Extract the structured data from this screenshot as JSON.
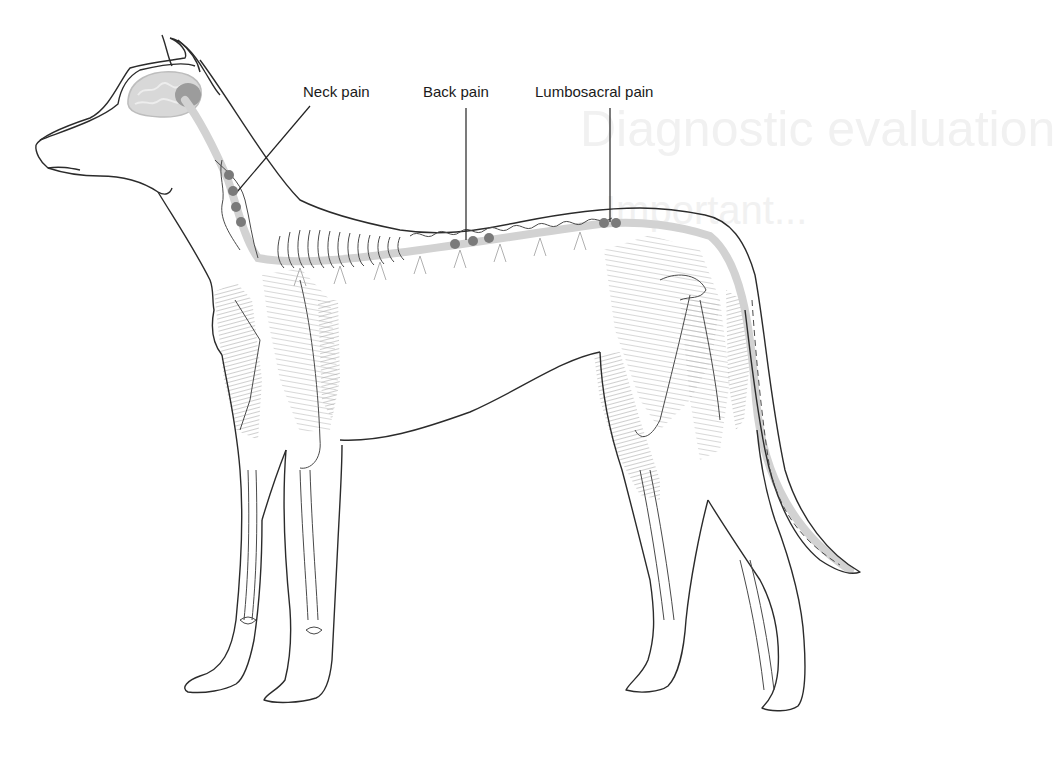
{
  "figure": {
    "labels": [
      {
        "id": "neck",
        "text": "Neck pain"
      },
      {
        "id": "back",
        "text": "Back pain"
      },
      {
        "id": "lumbosacral",
        "text": "Lumbosacral pain"
      }
    ],
    "pain_markers": {
      "neck": {
        "count": 4
      },
      "back": {
        "count": 3
      },
      "lumbosacral": {
        "count": 2
      }
    },
    "background_bleed_text": [
      "Diagnostic evaluation",
      "Important..."
    ],
    "colors": {
      "outline": "#2b2b2b",
      "marker": "#7a7a7a",
      "brain": "#cfcfcf",
      "brainstem": "#9c9c9c",
      "spinal_cord": "#d2d2d2",
      "muscle_shade": "#8a8a8a",
      "label_text": "#1a1a1a"
    }
  }
}
